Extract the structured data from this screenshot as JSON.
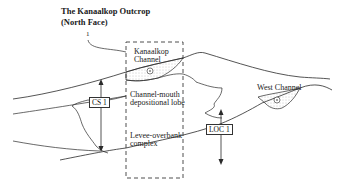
{
  "title": {
    "line1": "The Kanaalkop Outcrop",
    "line2": "(North Face)"
  },
  "marker_label": "1",
  "labels": {
    "kanaalkop_channel_1": "Kanaalkop",
    "kanaalkop_channel_2": "Channel",
    "lobe_1": "Channel-mouth",
    "lobe_2": "depositional lobe",
    "levee_1": "Levee-overbank",
    "levee_2": "complex",
    "west_channel": "West Channel"
  },
  "sections": {
    "cs1": "CS 1",
    "loc1": "LOC 1"
  },
  "colors": {
    "line": "#2a2a2a",
    "fill_stipple": "#9a9a9a",
    "background": "#ffffff"
  }
}
